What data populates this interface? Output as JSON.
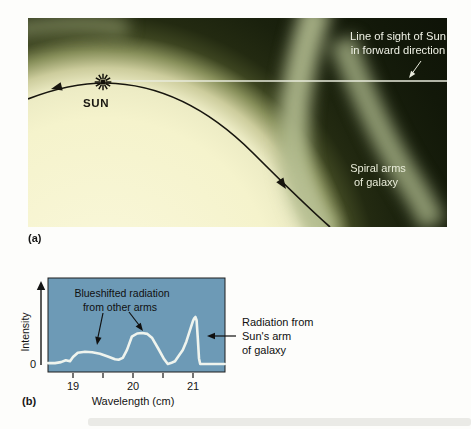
{
  "figure": {
    "panel_a": {
      "tag": "(a)",
      "labels": {
        "line_of_sight_1": "Line of sight of Sun",
        "line_of_sight_2": "in forward direction",
        "sun": "SUN",
        "spiral_arms_1": "Spiral arms",
        "spiral_arms_2": "of galaxy"
      }
    },
    "panel_b": {
      "tag": "(b)",
      "y_axis_label": "Intensity",
      "x_axis_label": "Wavelength (cm)",
      "origin_label": "0",
      "annotations": {
        "blueshifted_1": "Blueshifted radiation",
        "blueshifted_2": "from other arms",
        "sun_arm_1": "Radiation from",
        "sun_arm_2": "Sun's arm",
        "sun_arm_3": "of galaxy"
      }
    }
  },
  "colors": {
    "plot_background": "#6d9ab6",
    "spectrum_curve": "#eff4ee",
    "spiral_arm_light": "#b3bc90",
    "galaxy_dark": "#131a0b",
    "galaxy_cream": "#f5f3cc"
  },
  "chart_data": {
    "type": "line",
    "title": "",
    "xlabel": "Wavelength (cm)",
    "ylabel": "Intensity",
    "x_ticks": [
      19,
      20,
      21
    ],
    "x_minor_ticks": [
      19.5,
      20.5
    ],
    "x_range": [
      18.58,
      21.53
    ],
    "y_range": [
      0,
      1.15
    ],
    "y_baseline_label": "0",
    "grid": false,
    "legend": false,
    "series": [
      {
        "name": "21-cm line intensity (relative)",
        "x": [
          18.58,
          18.7,
          18.8,
          18.88,
          18.95,
          19.0,
          19.08,
          19.2,
          19.32,
          19.45,
          19.58,
          19.7,
          19.76,
          19.83,
          19.9,
          19.98,
          20.07,
          20.15,
          20.24,
          20.32,
          20.42,
          20.52,
          20.58,
          20.63,
          20.7,
          20.76,
          20.83,
          20.89,
          20.95,
          21.0,
          21.02,
          21.04,
          21.06,
          21.08,
          21.1,
          21.12,
          21.2,
          21.35,
          21.53
        ],
        "y": [
          0.02,
          0.02,
          0.04,
          0.08,
          0.06,
          0.15,
          0.24,
          0.26,
          0.25,
          0.22,
          0.16,
          0.1,
          0.09,
          0.13,
          0.3,
          0.58,
          0.65,
          0.66,
          0.64,
          0.55,
          0.33,
          0.1,
          0.0,
          0.02,
          0.06,
          0.17,
          0.3,
          0.48,
          0.72,
          0.92,
          0.97,
          1.0,
          0.93,
          0.55,
          0.12,
          0.0,
          0.0,
          0.0,
          0.0
        ],
        "color": "#eff4ee"
      }
    ],
    "annotations": [
      {
        "text": "Blueshifted radiation from other arms",
        "targets_wavelength": [
          19.35,
          20.15
        ]
      },
      {
        "text": "Radiation from Sun's arm of galaxy",
        "targets_wavelength": [
          21.0
        ]
      }
    ]
  }
}
